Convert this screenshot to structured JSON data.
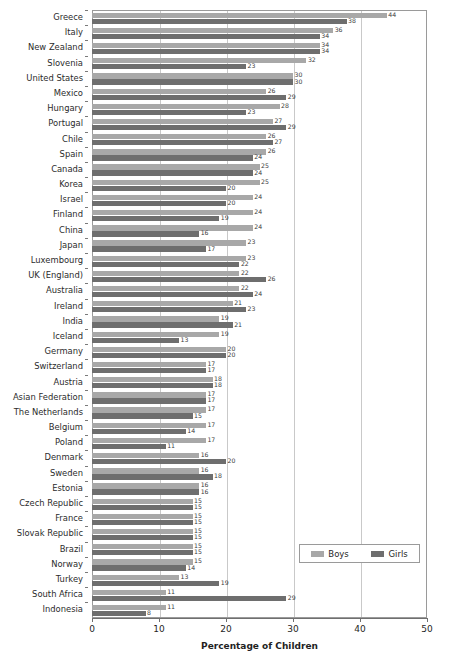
{
  "artifact_text": "",
  "chart_data": {
    "type": "bar",
    "orientation": "horizontal",
    "title": "",
    "subtitle": "",
    "xlabel": "Percentage of Children",
    "ylabel": "",
    "xlim": [
      0,
      50
    ],
    "xticks": [
      0,
      10,
      20,
      30,
      40,
      50
    ],
    "grid": true,
    "grid_axis": "x",
    "legend_position": "bottom-right",
    "categories": [
      "Greece",
      "Italy",
      "New Zealand",
      "Slovenia",
      "United States",
      "Mexico",
      "Hungary",
      "Portugal",
      "Chile",
      "Spain",
      "Canada",
      "Korea",
      "Israel",
      "Finland",
      "China",
      "Japan",
      "Luxembourg",
      "UK (England)",
      "Australia",
      "Ireland",
      "India",
      "Iceland",
      "Germany",
      "Switzerland",
      "Austria",
      "Asian Federation",
      "The Netherlands",
      "Belgium",
      "Poland",
      "Denmark",
      "Sweden",
      "Estonia",
      "Czech Republic",
      "France",
      "Slovak Republic",
      "Brazil",
      "Norway",
      "Turkey",
      "South Africa",
      "Indonesia"
    ],
    "series": [
      {
        "name": "Boys",
        "color": "#a8a8a8",
        "values": [
          44,
          36,
          34,
          32,
          30,
          26,
          28,
          27,
          26,
          26,
          25,
          25,
          24,
          24,
          24,
          23,
          23,
          22,
          22,
          21,
          19,
          19,
          20,
          17,
          18,
          17,
          17,
          17,
          17,
          16,
          16,
          16,
          15,
          15,
          15,
          15,
          15,
          13,
          11,
          11
        ]
      },
      {
        "name": "Girls",
        "color": "#6e6e6e",
        "values": [
          38,
          34,
          34,
          23,
          30,
          29,
          23,
          29,
          27,
          24,
          24,
          20,
          20,
          19,
          16,
          17,
          22,
          26,
          24,
          23,
          21,
          13,
          20,
          17,
          18,
          17,
          15,
          14,
          11,
          20,
          18,
          16,
          15,
          15,
          15,
          15,
          14,
          19,
          29,
          8
        ]
      }
    ]
  },
  "legend": {
    "items": [
      {
        "label": "Boys",
        "color": "#a8a8a8"
      },
      {
        "label": "Girls",
        "color": "#6e6e6e"
      }
    ]
  },
  "axis": {
    "x_title": "Percentage of Children",
    "x_tick_labels": [
      "0",
      "10",
      "20",
      "30",
      "40",
      "50"
    ]
  }
}
